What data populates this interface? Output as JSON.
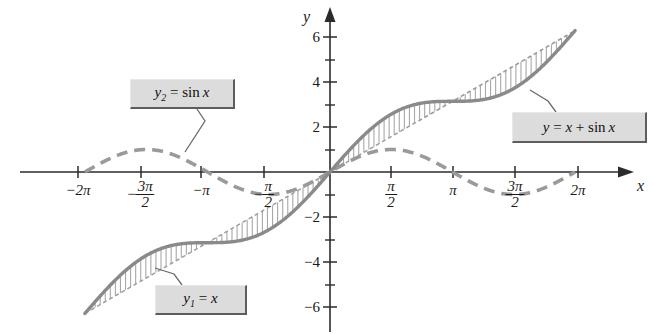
{
  "figure": {
    "background": "#ffffff"
  },
  "axes": {
    "x_axis_name": "x",
    "y_axis_name": "y",
    "origin_px": {
      "x": 330,
      "y": 172
    },
    "px_per_x_unit": 39.0,
    "px_per_y_unit": 22.5
  },
  "colors": {
    "axis": "#2b2b2b",
    "curve_sum": "#8a8a8a",
    "curve_sine": "#9a9a9a",
    "curve_line": "#9d9d9d",
    "hatch": "#a8a8a8",
    "callout_bg": "#dcdcdc",
    "callout_border": "#5d5d5d",
    "text": "#1a1a1a"
  },
  "callouts": [
    {
      "name": "sine-label",
      "prefix": "y",
      "subscript": "2",
      "body": " = sin x",
      "text": "y2 = sin x"
    },
    {
      "name": "sum-label",
      "prefix": "y",
      "subscript": "",
      "body": " = x + sin x",
      "text": "y = x + sin x"
    },
    {
      "name": "line-label",
      "prefix": "y",
      "subscript": "1",
      "body": " = x",
      "text": "y1 = x"
    }
  ],
  "x_ticks": [
    {
      "value": -6.2832,
      "label": "−2π",
      "type": "plain",
      "px": 78
    },
    {
      "value": -4.7124,
      "label": "−3π/2",
      "type": "fraction",
      "num": "3π",
      "den": "2",
      "negative": true,
      "px": 141
    },
    {
      "value": -3.1416,
      "label": "−π",
      "type": "plain",
      "px": 201
    },
    {
      "value": -1.5708,
      "label": "−π/2",
      "type": "fraction",
      "num": "π",
      "den": "2",
      "negative": true,
      "px": 264
    },
    {
      "value": 1.5708,
      "label": "π/2",
      "type": "fraction",
      "num": "π",
      "den": "2",
      "negative": false,
      "px": 391
    },
    {
      "value": 3.1416,
      "label": "π",
      "type": "plain",
      "px": 453
    },
    {
      "value": 4.7124,
      "label": "3π/2",
      "type": "fraction",
      "num": "3π",
      "den": "2",
      "negative": false,
      "px": 515
    },
    {
      "value": 6.2832,
      "label": "2π",
      "type": "plain",
      "px": 578
    }
  ],
  "y_ticks": [
    {
      "value": 6,
      "label": "6",
      "px": 37,
      "major": true
    },
    {
      "value": 5,
      "label": "",
      "px": 60,
      "major": false
    },
    {
      "value": 4,
      "label": "4",
      "px": 82,
      "major": true
    },
    {
      "value": 3,
      "label": "",
      "px": 105,
      "major": false
    },
    {
      "value": 2,
      "label": "2",
      "px": 127,
      "major": true
    },
    {
      "value": 1,
      "label": "",
      "px": 150,
      "major": false
    },
    {
      "value": -1,
      "label": "",
      "px": 195,
      "major": false
    },
    {
      "value": -2,
      "label": "−2",
      "px": 217,
      "major": true
    },
    {
      "value": -3,
      "label": "",
      "px": 240,
      "major": false
    },
    {
      "value": -4,
      "label": "−4",
      "px": 262,
      "major": true
    },
    {
      "value": -5,
      "label": "",
      "px": 285,
      "major": false
    },
    {
      "value": -6,
      "label": "−6",
      "px": 307,
      "major": true
    }
  ],
  "chart_data": {
    "type": "line",
    "xlabel": "x",
    "ylabel": "y",
    "xlim": [
      -6.2832,
      6.2832
    ],
    "ylim": [
      -6.5,
      6.5
    ],
    "grid": false,
    "legend_position": "callout-boxes",
    "x_tick_values": [
      -6.2832,
      -4.7124,
      -3.1416,
      -1.5708,
      1.5708,
      3.1416,
      4.7124,
      6.2832
    ],
    "x_tick_labels": [
      "−2π",
      "−3π/2",
      "−π",
      "−π/2",
      "π/2",
      "π",
      "3π/2",
      "2π"
    ],
    "y_tick_values": [
      -6,
      -4,
      -2,
      2,
      4,
      6
    ],
    "y_tick_labels": [
      "−6",
      "−4",
      "−2",
      "2",
      "4",
      "6"
    ],
    "series": [
      {
        "name": "y = x + sin x",
        "style": "solid-thick-gray",
        "formula": "x + sin(x)",
        "x": [
          -6.2832,
          -5.4978,
          -4.7124,
          -3.927,
          -3.1416,
          -2.3562,
          -1.5708,
          -0.7854,
          0,
          0.7854,
          1.5708,
          2.3562,
          3.1416,
          3.927,
          4.7124,
          5.4978,
          6.2832
        ],
        "y": [
          -6.2832,
          -4.7907,
          -3.7124,
          -3.2199,
          -3.1416,
          -3.0633,
          -2.5708,
          -1.4925,
          0,
          1.4925,
          2.5708,
          3.0633,
          3.1416,
          3.2199,
          3.7124,
          4.7907,
          6.2832
        ]
      },
      {
        "name": "y1 = x",
        "style": "dotted-thin-gray",
        "formula": "x",
        "x": [
          -6.2832,
          6.2832
        ],
        "y": [
          -6.2832,
          6.2832
        ]
      },
      {
        "name": "y2 = sin x",
        "style": "dashed-thick-gray",
        "formula": "sin(x)",
        "x": [
          -6.2832,
          -5.4978,
          -4.7124,
          -3.927,
          -3.1416,
          -2.3562,
          -1.5708,
          -0.7854,
          0,
          0.7854,
          1.5708,
          2.3562,
          3.1416,
          3.927,
          4.7124,
          5.4978,
          6.2832
        ],
        "y": [
          0,
          0.7071,
          1,
          0.7071,
          0,
          -0.7071,
          -1,
          -0.7071,
          0,
          0.7071,
          1,
          0.7071,
          0,
          -0.7071,
          -1,
          -0.7071,
          0
        ]
      }
    ],
    "annotations": [
      {
        "text": "y2 = sin x",
        "target": "sine curve near -π/2"
      },
      {
        "text": "y = x + sin x",
        "target": "sum curve near 3π/2"
      },
      {
        "text": "y1 = x",
        "target": "line y=x near -3π/2"
      }
    ]
  }
}
